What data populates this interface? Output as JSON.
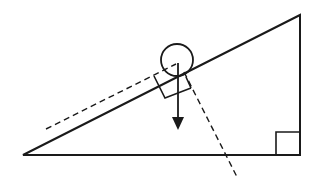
{
  "diagram": {
    "title": "",
    "background": "#ffffff",
    "stroke_color": "#1a1a1a",
    "elements": {
      "incline": {
        "type": "right-triangle",
        "right_angle_corner": "bottom-right"
      },
      "ball": {
        "type": "circle",
        "description": "ball resting on incline"
      },
      "gravity_arrow": {
        "type": "arrow",
        "direction": "down"
      },
      "parallel_component_line": {
        "type": "dashed-line",
        "orientation": "parallel to incline"
      },
      "perpendicular_component_line": {
        "type": "dashed-line",
        "orientation": "perpendicular to incline"
      },
      "right_angle_markers": 2
    }
  }
}
